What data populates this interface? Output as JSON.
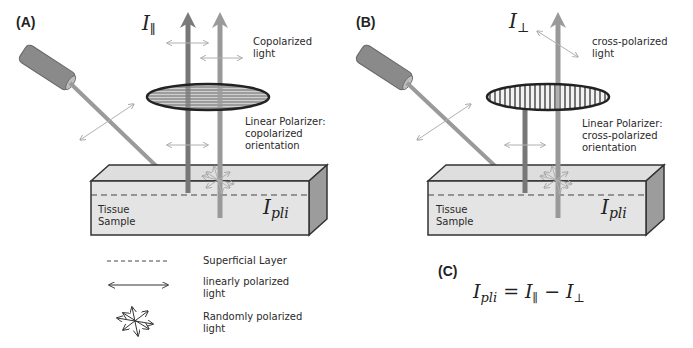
{
  "figure": {
    "panels": [
      {
        "id": "A",
        "label": "(A)",
        "intensity_symbol": "I",
        "intensity_subscript": "∥",
        "emerging_light_label": [
          "Copolarized",
          "light"
        ],
        "polarizer_label": [
          "Linear Polarizer:",
          "copolarized",
          "orientation"
        ],
        "polarizer_pattern": "horizontal-lines",
        "tissue_label": [
          "Tissue",
          "Sample"
        ],
        "tissue_intensity_symbol": "I",
        "tissue_intensity_subscript": "pli"
      },
      {
        "id": "B",
        "label": "(B)",
        "intensity_symbol": "I",
        "intensity_subscript": "⊥",
        "emerging_light_label": [
          "cross-polarized",
          "light"
        ],
        "polarizer_label": [
          "Linear Polarizer:",
          "cross-polarized",
          "orientation"
        ],
        "polarizer_pattern": "vertical-lines",
        "tissue_label": [
          "Tissue",
          "Sample"
        ],
        "tissue_intensity_symbol": "I",
        "tissue_intensity_subscript": "pli"
      }
    ],
    "legend": [
      {
        "symbol": "dashed-line",
        "label": [
          "Superficial Layer"
        ]
      },
      {
        "symbol": "double-arrow",
        "label": [
          "linearly polarized",
          "light"
        ]
      },
      {
        "symbol": "star-arrows",
        "label": [
          "Randomly polarized",
          "light"
        ]
      }
    ],
    "equation": {
      "label": "(C)",
      "lhs_symbol": "I",
      "lhs_subscript": "pli",
      "equals": "=",
      "term1_symbol": "I",
      "term1_subscript": "∥",
      "minus": "−",
      "term2_symbol": "I",
      "term2_subscript": "⊥"
    }
  }
}
